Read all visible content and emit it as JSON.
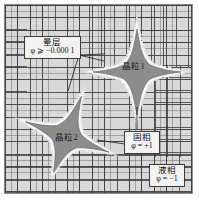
{
  "figure": {
    "title": "",
    "domain_background_color": "#d8d8d8",
    "solid_color": "#8c8c8c",
    "halo_color": "#f5f5f5",
    "frame_color": "#8a8a8a"
  },
  "callouts": [
    {
      "id": "halo",
      "name": "halo-layer-callout",
      "cn": "晕层",
      "eq": "φ ⩾ −0.000 1"
    },
    {
      "id": "solid",
      "name": "solid-phase-callout",
      "cn": "固相",
      "eq": "φ = +1"
    },
    {
      "id": "liquid",
      "name": "liquid-phase-callout",
      "cn": "液相",
      "eq": "φ = −1"
    }
  ],
  "grain_labels": [
    {
      "id": "grain1",
      "text": "晶粒1"
    },
    {
      "id": "grain2",
      "text": "晶粒2"
    }
  ],
  "mesh": {
    "fine_label": "fine-mesh",
    "coarse_label": "coarse-mesh"
  }
}
